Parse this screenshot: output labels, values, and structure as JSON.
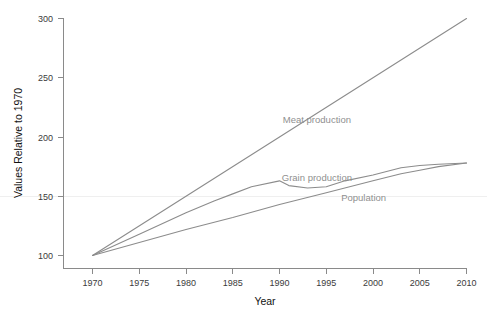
{
  "chart_data": {
    "type": "line",
    "title": "",
    "xlabel": "Year",
    "ylabel": "Values Relative to 1970",
    "xlim": [
      1970,
      2010
    ],
    "ylim": [
      100,
      300
    ],
    "xticks": [
      1970,
      1975,
      1980,
      1985,
      1990,
      1995,
      2000,
      2005,
      2010
    ],
    "yticks": [
      100,
      150,
      200,
      250,
      300
    ],
    "grid": "faint horizontal line at y=150 only",
    "legend_position": "inline labels on plot",
    "x": [
      1970,
      1975,
      1980,
      1985,
      1990,
      1995,
      2000,
      2005,
      2010
    ],
    "series": [
      {
        "name": "Meat production",
        "color": "#8c8c8c",
        "values": [
          100,
          125,
          150,
          175,
          200,
          225,
          250,
          275,
          300
        ],
        "label_x": 1994,
        "label_y": 212
      },
      {
        "name": "Grain production",
        "color": "#8c8c8c",
        "values": [
          100,
          118,
          136,
          152,
          163,
          158,
          168,
          176,
          178
        ],
        "label_x": 1994,
        "label_y": 163
      },
      {
        "name": "Population",
        "color": "#8c8c8c",
        "values": [
          100,
          111,
          122,
          132,
          143,
          153,
          163,
          172,
          178
        ],
        "label_x": 1999,
        "label_y": 146
      }
    ],
    "detail_points": {
      "Meat production": [
        [
          1970,
          100
        ],
        [
          2010,
          300
        ]
      ],
      "Grain production": [
        [
          1970,
          100
        ],
        [
          1975,
          118
        ],
        [
          1980,
          136
        ],
        [
          1983,
          146
        ],
        [
          1985,
          152
        ],
        [
          1987,
          158
        ],
        [
          1990,
          163
        ],
        [
          1991,
          159
        ],
        [
          1993,
          157
        ],
        [
          1995,
          158
        ],
        [
          1997,
          163
        ],
        [
          2000,
          168
        ],
        [
          2003,
          174
        ],
        [
          2005,
          176
        ],
        [
          2007,
          177
        ],
        [
          2010,
          178
        ]
      ],
      "Population": [
        [
          1970,
          100
        ],
        [
          1975,
          111
        ],
        [
          1980,
          122
        ],
        [
          1985,
          132
        ],
        [
          1990,
          143
        ],
        [
          1995,
          153
        ],
        [
          2000,
          163
        ],
        [
          2003,
          169
        ],
        [
          2005,
          172
        ],
        [
          2007,
          175
        ],
        [
          2010,
          178
        ]
      ]
    }
  },
  "axis": {
    "y_title": "Values Relative to 1970",
    "x_title": "Year",
    "y_tick_labels": [
      "300",
      "250",
      "200",
      "150",
      "100"
    ],
    "x_tick_labels": [
      "1970",
      "1975",
      "1980",
      "1985",
      "1990",
      "1995",
      "2000",
      "2005",
      "2010"
    ]
  },
  "labels": {
    "meat": "Meat production",
    "grain": "Grain production",
    "population": "Population"
  },
  "colors": {
    "line": "#8c8c8c",
    "axis": "#8a8a8a",
    "label_text": "#8f8f8f",
    "tick_text": "#3b3b3b",
    "background": "#ffffff"
  }
}
